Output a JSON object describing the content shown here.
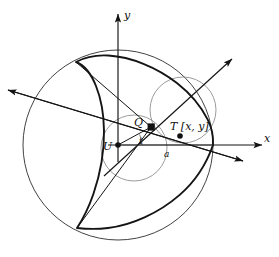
{
  "figure": {
    "background": "#ffffff",
    "stroke_dark": "#141414",
    "stroke_light": "#4a4a4a",
    "stroke_thin": "#666666"
  },
  "axes": {
    "x_label": "x",
    "y_label": "y",
    "origin_label": "U",
    "x_axis": {
      "x1": 108,
      "y1": 145,
      "x2": 262,
      "y2": 145
    },
    "y_axis": {
      "x1": 118,
      "y1": 160,
      "x2": 118,
      "y2": 14
    },
    "x_label_pos": {
      "x": 264,
      "y": 141
    },
    "y_label_pos": {
      "x": 124,
      "y": 17
    }
  },
  "points": [
    {
      "name": "U",
      "label": "U",
      "x": 118,
      "y": 145,
      "marker": "dot",
      "label_x": 105,
      "label_y": 149
    },
    {
      "name": "Q",
      "label": "Q",
      "x": 151,
      "y": 127,
      "marker": "square",
      "label_x": 137,
      "label_y": 126
    },
    {
      "name": "T",
      "label": "T [x, y]",
      "x": 180,
      "y": 136,
      "marker": "dot",
      "label_x": 172,
      "label_y": 129
    }
  ],
  "annotations": {
    "angle_label": "t",
    "angle_label_pos": {
      "x": 140,
      "y": 143
    },
    "segment_label": "a",
    "segment_label_pos": {
      "x": 166,
      "y": 156
    }
  },
  "circles": {
    "fixed": {
      "cx": 118,
      "cy": 145,
      "r": 95
    },
    "inner_rolling": {
      "cx": 134,
      "cy": 148,
      "r": 33
    },
    "upper_rolling": {
      "cx": 183,
      "cy": 110,
      "r": 33
    }
  },
  "deltoid": {
    "center": {
      "x": 118,
      "y": 145
    },
    "R": 95,
    "cusps": [
      {
        "x": 213,
        "y": 145
      },
      {
        "x": 76,
        "y": 62
      },
      {
        "x": 77,
        "y": 228
      }
    ]
  },
  "rays": [
    {
      "name": "tangent-ray",
      "x1": 8,
      "y1": 90,
      "x2": 243,
      "y2": 161
    },
    {
      "name": "normal-ray",
      "x1": 104,
      "y1": 176,
      "x2": 232,
      "y2": 59
    }
  ]
}
